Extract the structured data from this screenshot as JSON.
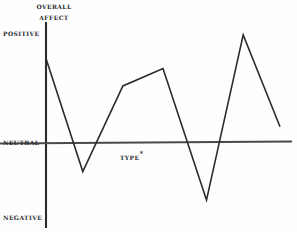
{
  "figure": {
    "title_line1": "Overall",
    "title_line2": "Affect",
    "background_color": "#fefefe",
    "ink_color": "#2b2b2b"
  },
  "axis_labels": {
    "positive": "Positive",
    "neutral": "Neutral",
    "negative": "Negative",
    "x_axis": "Type",
    "x_axis_footnote": "*"
  },
  "chart_data": {
    "type": "line",
    "title": "Overall Affect",
    "xlabel": "Type*",
    "ylabel": "Overall Affect",
    "grid": false,
    "legend": "none",
    "y_tick_labels": [
      "Positive",
      "Neutral",
      "Negative"
    ],
    "y_tick_values": [
      1,
      0,
      -1
    ],
    "ylim": [
      -1.35,
      1.25
    ],
    "xlim": [
      0,
      7
    ],
    "x_tick_labels": [],
    "series": [
      {
        "name": "Overall affect by type",
        "x": [
          0,
          1.1,
          2.3,
          3.5,
          4.8,
          5.9,
          7.0
        ],
        "values": [
          0.82,
          -0.29,
          0.55,
          0.72,
          -0.57,
          1.05,
          0.15
        ]
      }
    ],
    "annotations": [
      {
        "text": "Type*",
        "x": 2.2,
        "y": -0.09
      }
    ]
  }
}
